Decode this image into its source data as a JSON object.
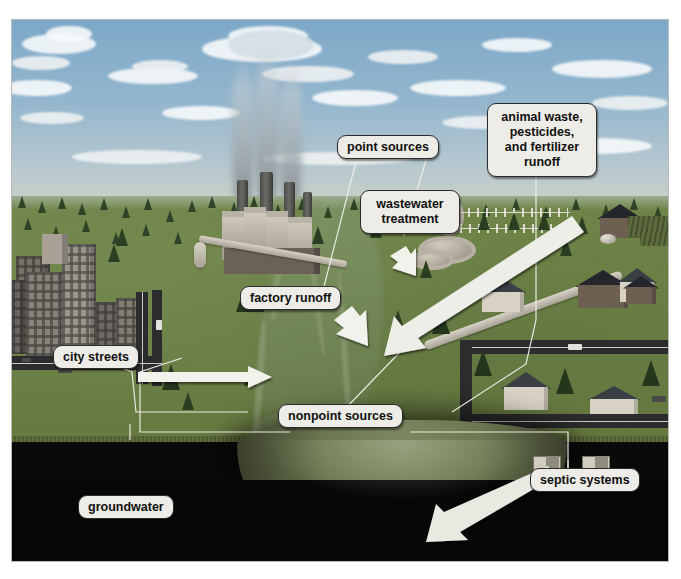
{
  "figure": {
    "type": "illustrated-diagram"
  },
  "labels": {
    "point_sources": "point sources",
    "animal_waste": "animal waste,\npesticides,\nand fertilizer\nrunoff",
    "wastewater_treatment": "wastewater\ntreatment",
    "factory_runoff": "factory runoff",
    "city_streets": "city streets",
    "nonpoint_sources": "nonpoint sources",
    "septic_systems": "septic systems",
    "groundwater": "groundwater"
  },
  "scene_elements": {
    "sky": "sky-with-clouds",
    "smokestacks": "factory-smokestacks-emitting-smoke",
    "factory": "industrial-factory-buildings",
    "treatment_plant": "wastewater-treatment-clarifier-tanks",
    "farm": "farm-barn-and-fields",
    "city": "city-skyline-buildings",
    "suburb": "suburban-houses-and-streets",
    "river": "river-flowing-through-landscape",
    "groundwater_zone": "subsurface-groundwater-aquifer"
  },
  "arrows": [
    {
      "name": "factory-runoff-arrow",
      "direction": "down-right"
    },
    {
      "name": "wastewater-discharge-arrow",
      "direction": "down-right"
    },
    {
      "name": "farm-runoff-arrow",
      "direction": "down-left"
    },
    {
      "name": "city-streets-runoff-arrow",
      "direction": "right"
    },
    {
      "name": "septic-to-groundwater-arrow",
      "direction": "down-left"
    }
  ],
  "colors": {
    "label_background": "#edece7",
    "label_border": "#2b2b2b",
    "label_text": "#111111",
    "sky": "#7ea8c8",
    "ground": "#6e8448",
    "groundwater": "#0a0a0a",
    "arrow_fill": "#f2f2ec",
    "leader_line": "#f0f0ea"
  }
}
